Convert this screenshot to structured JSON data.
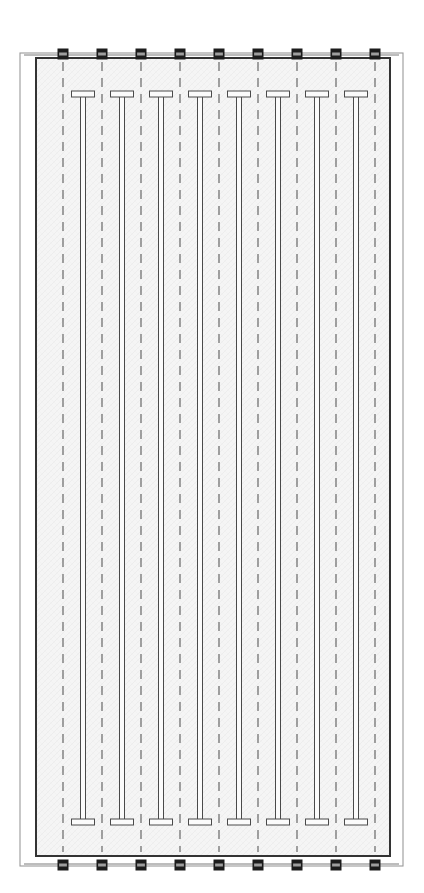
{
  "drawing": {
    "title": "Structural Framing Plan",
    "type": "plan-view",
    "sheet": {
      "width": 424,
      "height": 893,
      "background_color": "#ffffff",
      "top_rule": {
        "name": "page-edge-rule",
        "y": 12,
        "x1": 0,
        "x2": 424,
        "color": "#8d8d8d",
        "thickness": 1.2
      }
    },
    "outer_frame": {
      "name": "outer-boundary-rectangle",
      "x": 20,
      "y": 53,
      "width": 383,
      "height": 813,
      "stroke": "#9a9a9a",
      "stroke_width": 1.1,
      "fill": "none"
    },
    "slab": {
      "name": "slab-outline-rectangle",
      "x": 36,
      "y": 58,
      "width": 354,
      "height": 798,
      "stroke": "#333333",
      "stroke_width": 2.0,
      "fill": "#f4f4f4",
      "hatch_color": "#e4e4e4"
    },
    "connector_lines": [
      {
        "name": "top-tie-line",
        "y": 55,
        "x1": 24,
        "x2": 399,
        "color": "#7b7b7b",
        "thickness": 1.0
      },
      {
        "name": "bottom-tie-line",
        "y": 864,
        "x1": 24,
        "x2": 399,
        "color": "#7b7b7b",
        "thickness": 1.0
      }
    ],
    "gridlines": {
      "name": "dashed-grid-lines",
      "count": 9,
      "x_positions": [
        63,
        102,
        141,
        180,
        219,
        258,
        297,
        336,
        375
      ],
      "y_top": 62,
      "y_bottom": 852,
      "color": "#5a5a5a",
      "thickness": 1.1,
      "dash_pattern": "9 7"
    },
    "support_markers": {
      "name": "support-marker-squares",
      "count_top": 9,
      "count_bottom": 9,
      "x_positions": [
        63,
        102,
        141,
        180,
        219,
        258,
        297,
        336,
        375
      ],
      "y_top": 54,
      "y_bottom": 865,
      "size": 11,
      "outer_color": "#1c1c1c",
      "inner_band_color": "#9e9e9e"
    },
    "beams": {
      "name": "t-beam-elements",
      "count": 8,
      "x_centers": [
        83,
        122,
        161,
        200,
        239,
        278,
        317,
        356
      ],
      "stem": {
        "y_top": 96,
        "y_bottom": 820,
        "width": 5,
        "stroke": "#4a4a4a",
        "stroke_width": 1.0,
        "fill": "#fbfbfb"
      },
      "head_top": {
        "y": 91,
        "width": 23,
        "height": 6
      },
      "head_bottom": {
        "y": 819,
        "width": 23,
        "height": 6
      },
      "head_stroke": "#4a4a4a",
      "head_fill": "#fbfbfb"
    },
    "legend": {
      "beam_label": "T-beam",
      "grid_label": "grid line",
      "marker_label": "support",
      "slab_label": "slab"
    }
  }
}
